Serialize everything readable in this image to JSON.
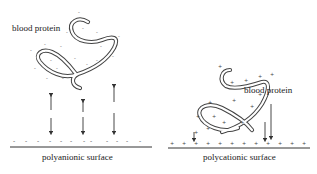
{
  "left_panel": {
    "protein_label": "blood protein",
    "surface_label": "polyanionic surface",
    "surface_charge": "-",
    "interaction": "repulsion"
  },
  "right_panel": {
    "protein_label": "blood protein",
    "surface_label": "polycationic surface",
    "surface_charge": "+",
    "interaction": "attraction"
  },
  "colors": {
    "line": "#333333",
    "background": "#ffffff"
  }
}
